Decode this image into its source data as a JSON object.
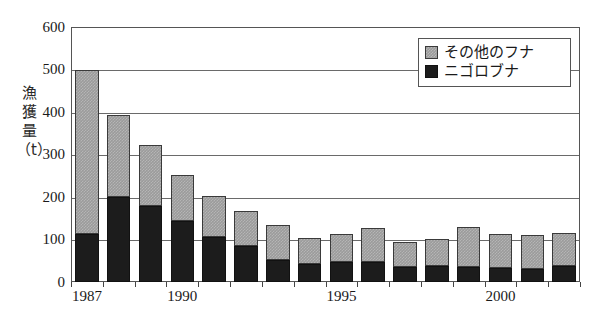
{
  "chart_data": {
    "type": "bar",
    "subtype": "stacked",
    "title": "",
    "xlabel": "",
    "ylabel": "漁獲量（t）",
    "ylabel_chars": [
      "漁",
      "獲",
      "量"
    ],
    "ylabel_unit": "（t）",
    "ylim": [
      0,
      600
    ],
    "ytick_values": [
      0,
      100,
      200,
      300,
      400,
      500,
      600
    ],
    "ytick_labels": [
      "0",
      "100",
      "200",
      "300",
      "400",
      "500",
      "600"
    ],
    "grid": true,
    "legend_position": "top-right",
    "categories": [
      1987,
      1988,
      1989,
      1990,
      1991,
      1992,
      1993,
      1994,
      1995,
      1996,
      1997,
      1998,
      1999,
      2000,
      2001,
      2002
    ],
    "xtick_labels": [
      "1987",
      "1990",
      "1995",
      "2000"
    ],
    "xtick_years": [
      1987,
      1990,
      1995,
      2000
    ],
    "series": [
      {
        "name": "ニゴロブナ",
        "color": "#1c1c1c",
        "values": [
          112,
          200,
          180,
          143,
          107,
          85,
          52,
          42,
          46,
          48,
          36,
          37,
          35,
          33,
          30,
          37
        ]
      },
      {
        "name": "その他のフナ",
        "color": "#9b9b9b",
        "values": [
          388,
          192,
          142,
          109,
          96,
          83,
          81,
          62,
          66,
          80,
          58,
          64,
          95,
          79,
          81,
          78
        ]
      }
    ],
    "totals": [
      500,
      392,
      322,
      252,
      203,
      168,
      133,
      104,
      112,
      128,
      94,
      101,
      130,
      112,
      111,
      115
    ]
  },
  "legend": {
    "entries": [
      {
        "label": "その他のフナ",
        "swatch": "gray-hatched"
      },
      {
        "label": "ニゴロブナ",
        "swatch": "black"
      }
    ]
  },
  "colors": {
    "other_funa": "#9b9b9b",
    "nigorobuna": "#1c1c1c",
    "axis": "#555555",
    "grid": "#6a6a6a",
    "background": "#ffffff"
  }
}
